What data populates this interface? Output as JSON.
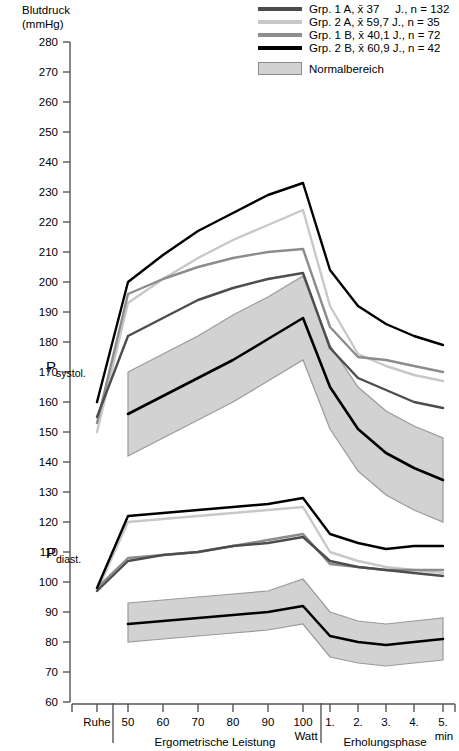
{
  "axis": {
    "y_title": "Blutdruck\n(mmHg)"
  },
  "legend": {
    "items": [
      {
        "label": "Grp. 1 A, x̄ 37     J., n = 132",
        "color": "#4d4d4d",
        "name": "grp-1a"
      },
      {
        "label": "Grp. 2 A, x̄ 59,7 J., n = 35",
        "color": "#c8c8c8",
        "name": "grp-2a"
      },
      {
        "label": "Grp. 1 B, x̄ 40,1 J., n = 72",
        "color": "#8c8c8c",
        "name": "grp-1b"
      },
      {
        "label": "Grp. 2 B, x̄ 60,9 J., n = 42",
        "color": "#000000",
        "name": "grp-2b"
      }
    ],
    "band": {
      "label": "Normalbereich",
      "fill": "#d2d2d2",
      "stroke": "#8a8a8a"
    }
  },
  "series_labels": {
    "systolic": {
      "main": "P",
      "sub": "systol."
    },
    "diastolic": {
      "main": "P",
      "sub": "diast."
    }
  },
  "chart_data": {
    "type": "line",
    "title": "Blutdruck (mmHg)",
    "xlabel": "",
    "ylabel": "Blutdruck (mmHg)",
    "ylim": [
      60,
      280
    ],
    "yticks": [
      280,
      270,
      260,
      250,
      240,
      230,
      220,
      210,
      200,
      190,
      180,
      170,
      160,
      150,
      140,
      130,
      120,
      110,
      100,
      90,
      80,
      70,
      60
    ],
    "grid": false,
    "legend_position": "top-right",
    "x": [
      "Ruhe",
      "50",
      "60",
      "70",
      "80",
      "90",
      "100",
      "1.",
      "2.",
      "3.",
      "4.",
      "5."
    ],
    "x_tick_labels": [
      "Ruhe",
      "50",
      "60",
      "70",
      "80",
      "90",
      "100",
      "1.",
      "2.",
      "3.",
      "4.",
      "5."
    ],
    "x_sections": [
      {
        "label": "Ergometrische Leistung",
        "unit": "Watt",
        "from": "50",
        "to": "100"
      },
      {
        "label": "Erholungsphase",
        "unit": "min",
        "from": "1.",
        "to": "5."
      }
    ],
    "series": [
      {
        "name": "Grp. 1 A systolisch",
        "group": "Grp. 1 A",
        "measure": "systolic",
        "color": "#4d4d4d",
        "values": [
          155,
          182,
          188,
          194,
          198,
          201,
          203,
          178,
          168,
          164,
          160,
          158
        ]
      },
      {
        "name": "Grp. 2 A systolisch",
        "group": "Grp. 2 A",
        "measure": "systolic",
        "color": "#c8c8c8",
        "values": [
          150,
          193,
          201,
          208,
          214,
          219,
          224,
          192,
          176,
          172,
          169,
          167
        ]
      },
      {
        "name": "Grp. 1 B systolisch",
        "group": "Grp. 1 B",
        "measure": "systolic",
        "color": "#8c8c8c",
        "values": [
          153,
          196,
          201,
          205,
          208,
          210,
          211,
          185,
          175,
          174,
          172,
          170
        ]
      },
      {
        "name": "Grp. 2 B systolisch",
        "group": "Grp. 2 B",
        "measure": "systolic",
        "color": "#000000",
        "values": [
          160,
          200,
          209,
          217,
          223,
          229,
          233,
          204,
          192,
          186,
          182,
          179
        ]
      },
      {
        "name": "Grp. 1 A diastolisch",
        "group": "Grp. 1 A",
        "measure": "diastolic",
        "color": "#4d4d4d",
        "values": [
          97,
          107,
          109,
          110,
          112,
          113,
          115,
          107,
          105,
          104,
          103,
          102
        ]
      },
      {
        "name": "Grp. 2 A diastolisch",
        "group": "Grp. 2 A",
        "measure": "diastolic",
        "color": "#c8c8c8",
        "values": [
          97,
          120,
          121,
          122,
          123,
          124,
          125,
          110,
          107,
          105,
          104,
          103
        ]
      },
      {
        "name": "Grp. 1 B diastolisch",
        "group": "Grp. 1 B",
        "measure": "diastolic",
        "color": "#8c8c8c",
        "values": [
          98,
          108,
          109,
          110,
          112,
          114,
          116,
          106,
          105,
          104,
          104,
          104
        ]
      },
      {
        "name": "Grp. 2 B diastolisch",
        "group": "Grp. 2 B",
        "measure": "diastolic",
        "color": "#000000",
        "values": [
          98,
          122,
          123,
          124,
          125,
          126,
          128,
          116,
          113,
          111,
          112,
          112
        ]
      },
      {
        "name": "Normalbereich systolisch Mittelwert",
        "group": "Normalbereich",
        "measure": "systolic",
        "color": "#000000",
        "values": [
          null,
          156,
          162,
          168,
          174,
          181,
          188,
          165,
          151,
          143,
          138,
          134
        ]
      },
      {
        "name": "Normalbereich diastolisch Mittelwert",
        "group": "Normalbereich",
        "measure": "diastolic",
        "color": "#000000",
        "values": [
          null,
          86,
          87,
          88,
          89,
          90,
          92,
          82,
          80,
          79,
          80,
          81
        ]
      }
    ],
    "bands": [
      {
        "name": "Normalbereich systolisch",
        "measure": "systolic",
        "fill": "#d2d2d2",
        "stroke": "#9a9a9a",
        "upper": [
          null,
          170,
          176,
          182,
          189,
          195,
          202,
          179,
          165,
          157,
          152,
          148
        ],
        "lower": [
          null,
          142,
          148,
          154,
          160,
          167,
          174,
          151,
          137,
          129,
          124,
          120
        ]
      },
      {
        "name": "Normalbereich diastolisch",
        "measure": "diastolic",
        "fill": "#d2d2d2",
        "stroke": "#9a9a9a",
        "upper": [
          null,
          93,
          94,
          95,
          96,
          97,
          101,
          90,
          87,
          86,
          87,
          88
        ],
        "lower": [
          null,
          80,
          81,
          82,
          83,
          84,
          86,
          75,
          73,
          72,
          73,
          74
        ]
      }
    ]
  }
}
